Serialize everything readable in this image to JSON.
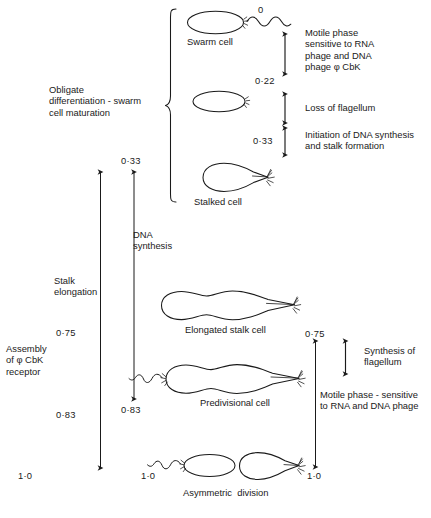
{
  "figure": {
    "time_unit": "fraction of cell cycle"
  },
  "left_column": {
    "bracket_label": "Obligate\ndifferentiation - swarm\ncell maturation",
    "stalk_elongation_label": "Stalk\nelongation",
    "stalk_top_value": "0·75",
    "stalk_bottom_value": "0·83",
    "assembly_label": "Assembly\nof φ CbK\nreceptor"
  },
  "middle_column": {
    "dna_label": "DNA\nsynthesis",
    "dna_top_value": "0·33",
    "dna_bottom_value": "0·83",
    "bottom_value": "1·0"
  },
  "cells": [
    {
      "name": "swarm-cell",
      "label": "Swarm cell",
      "time": "0"
    },
    {
      "name": "flagellum-loss-cell",
      "label": "",
      "time": "0·22"
    },
    {
      "name": "stalked-cell",
      "label": "Stalked cell",
      "time": "0·33"
    },
    {
      "name": "elongated-stalk-cell",
      "label": "Elongated stalk cell",
      "time": ""
    },
    {
      "name": "predivisional-cell",
      "label": "Predivisional cell",
      "time": ""
    },
    {
      "name": "asymmetric-division",
      "label": "Asymmetric  division",
      "time": "1·0"
    }
  ],
  "right_column": {
    "motile_top_label": "Motile phase\nsensitive to RNA\nphage and DNA\nphage φ CbK",
    "flagellum_loss_label": "Loss of flagellum",
    "dna_initiation_label": "Initiation of DNA synthesis\nand stalk formation",
    "synthesis_flagellum_label": "Synthesis of\nflagellum",
    "motile_bottom_label": "Motile phase - sensitive\nto RNA and DNA phage",
    "top_value": "0·75",
    "bottom_value": "1·0"
  },
  "markers": {
    "t0": "0",
    "t022": "0·22",
    "t033": "0·33",
    "t075": "0·75",
    "t083": "0·83",
    "t10": "1·0"
  },
  "colors": {
    "ink": "#1a1a1a",
    "background": "#ffffff"
  }
}
